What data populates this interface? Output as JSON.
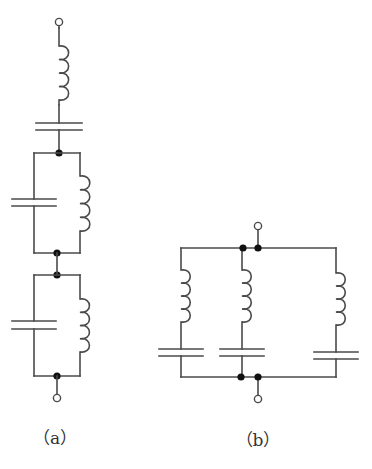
{
  "diagram": {
    "type": "circuit-schematic",
    "stroke_color": "#4a4a4a",
    "node_color": "#111111",
    "circuits": [
      {
        "id": "a",
        "label": "（a）",
        "label_pos": [
          55,
          424
        ],
        "description": "Series chain: inductor, capacitor, then two parallel LC tanks connected in series",
        "components": [
          {
            "type": "terminal",
            "x": 59,
            "y": 22
          },
          {
            "type": "inductor",
            "x": 59,
            "y1": 28,
            "y2": 105,
            "coil_top": 46,
            "coil_bottom": 100,
            "turns": 4
          },
          {
            "type": "capacitor",
            "x": 59,
            "y1": 105,
            "y2": 153,
            "plate1": 123,
            "plate2": 130,
            "half_width": 23
          },
          {
            "type": "node",
            "x": 59,
            "y": 153
          },
          {
            "type": "parallel-lc",
            "left_x": 34,
            "right_x": 80,
            "top": 153,
            "bottom": 253,
            "cap_plates": [
              199,
              206
            ],
            "cap_half_width": 22,
            "coil_top": 176,
            "coil_bottom": 231,
            "turns": 4
          },
          {
            "type": "node",
            "x": 57,
            "y": 253
          },
          {
            "type": "node",
            "x": 57,
            "y": 275
          },
          {
            "type": "parallel-lc",
            "left_x": 34,
            "right_x": 80,
            "top": 275,
            "bottom": 376,
            "cap_plates": [
              321,
              329
            ],
            "cap_half_width": 22,
            "coil_top": 299,
            "coil_bottom": 352,
            "turns": 4
          },
          {
            "type": "node",
            "x": 57,
            "y": 376
          },
          {
            "type": "terminal",
            "x": 57,
            "y": 398
          }
        ]
      },
      {
        "id": "b",
        "label": "（b）",
        "label_pos": [
          258,
          426
        ],
        "description": "Three series LC branches connected in parallel",
        "top_rail": {
          "y": 248,
          "x1": 181,
          "x2": 336
        },
        "bottom_rail": {
          "y": 377,
          "x1": 181,
          "x2": 336
        },
        "nodes": [
          [
            243,
            248
          ],
          [
            258,
            248
          ],
          [
            241,
            377
          ],
          [
            258,
            377
          ]
        ],
        "terminals": [
          [
            258,
            226
          ],
          [
            258,
            399
          ]
        ],
        "branches": [
          {
            "x": 181,
            "coil_top": 270,
            "coil_bottom": 322,
            "cap_plates": [
              349,
              356
            ],
            "cap_half_width": 22,
            "turns": 4
          },
          {
            "x": 242,
            "coil_top": 270,
            "coil_bottom": 322,
            "cap_plates": [
              349,
              356
            ],
            "cap_half_width": 22,
            "turns": 4
          },
          {
            "x": 336,
            "coil_top": 273,
            "coil_bottom": 325,
            "cap_plates": [
              352,
              359
            ],
            "cap_half_width": 22,
            "turns": 4
          }
        ]
      }
    ]
  }
}
